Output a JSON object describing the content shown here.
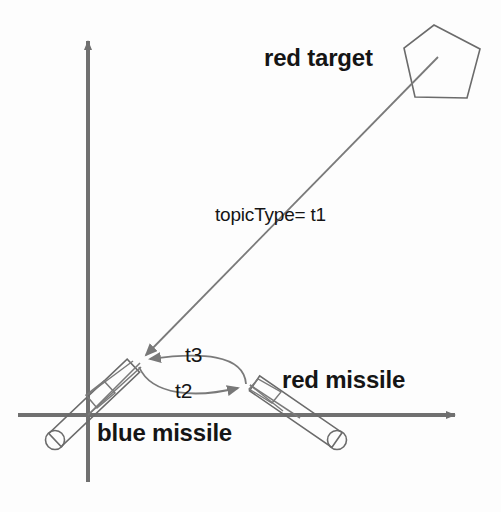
{
  "figure": {
    "type": "scenario-diagram",
    "background_color": "#fdfdfd",
    "stroke_color": "#6b6b6b",
    "axis_color": "#707070",
    "text_color": "#151515"
  },
  "axes": {
    "origin": {
      "x": 88,
      "y": 415
    },
    "y_axis": {
      "label": "",
      "from": {
        "x": 88,
        "y": 482
      },
      "to": {
        "x": 88,
        "y": 34
      },
      "arrow": "up"
    },
    "x_axis": {
      "label": "",
      "from": {
        "x": 18,
        "y": 415
      },
      "to": {
        "x": 462,
        "y": 415
      },
      "arrow": "right"
    }
  },
  "labels": {
    "red_target": "red target",
    "red_missile": "red missile",
    "blue_missile": "blue missile",
    "topic_type": "topicType= t1",
    "t3": "t3",
    "t2": "t2"
  },
  "entities": [
    {
      "name": "red-target",
      "shape": "pentagon",
      "label": "red target",
      "center": {
        "x": 441,
        "y": 62
      },
      "vertices": [
        {
          "x": 434,
          "y": 25
        },
        {
          "x": 480,
          "y": 49
        },
        {
          "x": 467,
          "y": 98
        },
        {
          "x": 415,
          "y": 97
        },
        {
          "x": 404,
          "y": 48
        }
      ]
    },
    {
      "name": "blue-missile",
      "shape": "capsule",
      "label": "blue missile",
      "tail": {
        "x": 55,
        "y": 440
      },
      "head": {
        "x": 133,
        "y": 366
      },
      "radius": 9
    },
    {
      "name": "red-missile",
      "shape": "capsule",
      "label": "red missile",
      "tail": {
        "x": 337,
        "y": 440
      },
      "head": {
        "x": 254,
        "y": 383
      },
      "radius": 9
    }
  ],
  "arrows": [
    {
      "name": "topic-type-t1",
      "label": "topicType= t1",
      "style": "straight",
      "from": {
        "x": 430,
        "y": 66
      },
      "to": {
        "x": 138,
        "y": 360
      },
      "arrowhead_at": "to"
    },
    {
      "name": "t3",
      "label": "t3",
      "style": "curved",
      "from": {
        "x": 246,
        "y": 384
      },
      "to": {
        "x": 141,
        "y": 360
      },
      "arrowhead_at": "to"
    },
    {
      "name": "t2",
      "label": "t2",
      "style": "curved",
      "from": {
        "x": 141,
        "y": 366
      },
      "to": {
        "x": 246,
        "y": 386
      },
      "arrowhead_at": "to"
    }
  ],
  "annotations": {
    "angle_marker": {
      "name": "angle-marker",
      "vertex": {
        "x": 88,
        "y": 415
      },
      "description": "small quadrilateral angle marker at origin between blue missile axis and sight line"
    }
  }
}
